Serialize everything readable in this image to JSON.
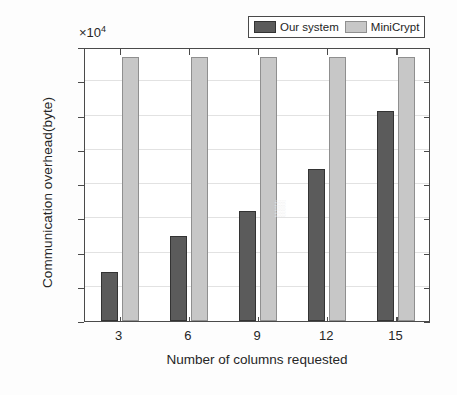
{
  "chart_data": {
    "type": "bar",
    "title": "",
    "subtitle": "",
    "xlabel": "Number of columns requested",
    "ylabel": "Communication overhead(byte)",
    "y_multiplier_text": "×10",
    "y_multiplier_exponent": "4",
    "y_multiplier_value": 10000,
    "categories": [
      "3",
      "6",
      "9",
      "12",
      "15"
    ],
    "series": [
      {
        "name": "Our system",
        "color": "#5b5b5b",
        "values": [
          7200,
          12400,
          16100,
          22200,
          30700
        ]
      },
      {
        "name": "MiniCrypt",
        "color": "#c7c7c7",
        "values": [
          38500,
          38500,
          38500,
          38500,
          38500
        ]
      }
    ],
    "ylim": [
      0,
      40000
    ],
    "yticks": [
      0,
      5000,
      10000,
      15000,
      20000,
      25000,
      30000,
      35000,
      40000
    ],
    "ytick_labels": [
      "0",
      "0.5",
      "1",
      "1.5",
      "2",
      "2.5",
      "3",
      "3.5",
      "4"
    ],
    "grid": true,
    "grid_axis": "y",
    "legend_position": "top-right",
    "legend_entries": [
      "Our system",
      "MiniCrypt"
    ]
  },
  "axes": {
    "y_title": "Communication overhead(byte)",
    "x_title": "Number of columns requested"
  },
  "legend": {
    "items": [
      {
        "label": "Our system",
        "swatch": "dark-gray-swatch"
      },
      {
        "label": "MiniCrypt",
        "swatch": "light-gray-swatch"
      }
    ]
  },
  "colors": {
    "series_our_system": "#5b5b5b",
    "series_minicrypt": "#c7c7c7",
    "axis": "#4a4a4a",
    "grid": "#e2e2e2",
    "background": "#ffffff"
  }
}
